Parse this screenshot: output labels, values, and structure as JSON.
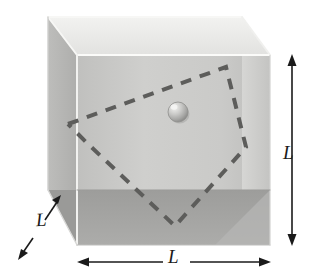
{
  "figure": {
    "labels": {
      "height": "L",
      "width": "L",
      "depth": "L"
    },
    "colors": {
      "top_face": "#ededea",
      "back_face": "#c9c9c7",
      "left_face": "#b3b3b1",
      "floor_face": "#a3a3a1",
      "right_inner_face": "#d8d8d6",
      "edge_light": "#f4f4f2",
      "edge_outline": "#b8b8b6",
      "dash_stroke": "#5a5a58",
      "arrow_stroke": "#1a1a1a",
      "ball_light": "#eeeeec",
      "ball_mid": "#c2c2c0",
      "ball_dark": "#8e8e8c",
      "background": "#ffffff"
    },
    "geometry": {
      "front_top_left": [
        77,
        55
      ],
      "front_top_right": [
        270,
        55
      ],
      "front_bottom_left": [
        77,
        245
      ],
      "front_bottom_right": [
        270,
        245
      ],
      "back_top_left": [
        48,
        17
      ],
      "back_top_right": [
        242,
        17
      ],
      "back_bottom_left": [
        48,
        190
      ],
      "back_bottom_right": [
        242,
        190
      ]
    },
    "ball": {
      "name": "ball",
      "center_x": 178,
      "center_y": 112,
      "radius": 10
    },
    "trajectory": {
      "name": "bouncing-ball-path",
      "style": "dashed",
      "vertices": [
        [
          68,
          124
        ],
        [
          226,
          67
        ],
        [
          246,
          147
        ],
        [
          175,
          226
        ],
        [
          87,
          143
        ],
        [
          68,
          124
        ]
      ]
    },
    "dimension_arrows": [
      {
        "name": "height-arrow",
        "orientation": "vertical",
        "x": 292,
        "y1": 56,
        "y2": 244
      },
      {
        "name": "width-arrow",
        "orientation": "horizontal",
        "y": 262,
        "x1": 78,
        "x2": 270
      },
      {
        "name": "depth-arrow",
        "orientation": "diagonal",
        "x1": 62,
        "y1": 196,
        "x2": 24,
        "y2": 252
      }
    ]
  }
}
